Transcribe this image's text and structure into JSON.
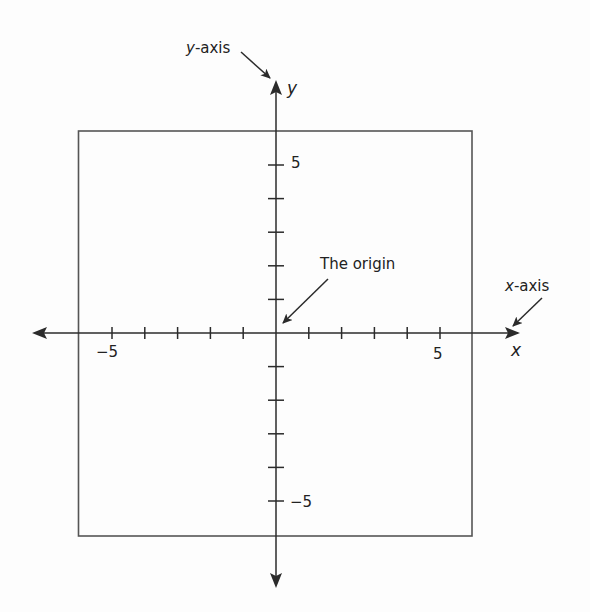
{
  "figure": {
    "colors": {
      "line": "#2b2b2b",
      "text": "#222222",
      "background": "#fdfdfd"
    },
    "callouts": {
      "y_axis": {
        "var": "y",
        "suffix": "-axis"
      },
      "x_axis": {
        "var": "x",
        "suffix": "-axis"
      },
      "origin": "The origin"
    },
    "axis_labels": {
      "x": "x",
      "y": "y"
    },
    "tick_labels": {
      "x_neg": "−5",
      "x_pos": "5",
      "y_pos": "5",
      "y_neg": "−5"
    },
    "grid": {
      "x_range": [
        -6,
        6
      ],
      "y_range": [
        -6,
        6
      ],
      "tick_step": 1,
      "labeled_ticks": [
        -5,
        5
      ]
    }
  }
}
